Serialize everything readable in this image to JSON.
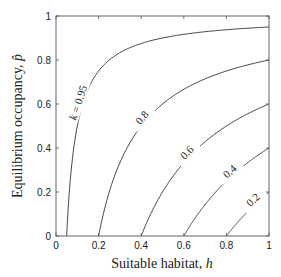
{
  "chart_data": {
    "type": "line",
    "title": "",
    "xlabel": "Suitable habitat, h",
    "ylabel": "Equilibrium occupancy, p̂",
    "xlim": [
      0,
      1
    ],
    "ylim": [
      0,
      1
    ],
    "grid": false,
    "legend": "none (curves labelled inline)",
    "x_ticks": [
      "0",
      "0.2",
      "0.4",
      "0.6",
      "0.8",
      "1"
    ],
    "y_ticks": [
      "0",
      "0.2",
      "0.4",
      "0.6",
      "0.8",
      "1"
    ],
    "formula": "p̂ = 1 − (1 − k)/h",
    "series": [
      {
        "name": "k = 0.95",
        "k": 0.95,
        "label": "k = 0.95",
        "x_intercept": 0.05,
        "value_at_h1": 0.95,
        "points": [
          [
            0.05,
            0
          ],
          [
            0.06,
            0.167
          ],
          [
            0.08,
            0.375
          ],
          [
            0.1,
            0.5
          ],
          [
            0.15,
            0.667
          ],
          [
            0.2,
            0.75
          ],
          [
            0.3,
            0.833
          ],
          [
            0.4,
            0.875
          ],
          [
            0.6,
            0.917
          ],
          [
            0.8,
            0.9375
          ],
          [
            1.0,
            0.95
          ]
        ]
      },
      {
        "name": "k = 0.8",
        "k": 0.8,
        "label": "0.8",
        "x_intercept": 0.2,
        "value_at_h1": 0.8,
        "points": [
          [
            0.2,
            0
          ],
          [
            0.25,
            0.2
          ],
          [
            0.3,
            0.333
          ],
          [
            0.4,
            0.5
          ],
          [
            0.5,
            0.6
          ],
          [
            0.6,
            0.667
          ],
          [
            0.7,
            0.714
          ],
          [
            0.8,
            0.75
          ],
          [
            0.9,
            0.778
          ],
          [
            1.0,
            0.8
          ]
        ]
      },
      {
        "name": "k = 0.6",
        "k": 0.6,
        "label": "0.6",
        "x_intercept": 0.4,
        "value_at_h1": 0.6,
        "points": [
          [
            0.4,
            0
          ],
          [
            0.5,
            0.2
          ],
          [
            0.6,
            0.333
          ],
          [
            0.7,
            0.429
          ],
          [
            0.8,
            0.5
          ],
          [
            0.9,
            0.556
          ],
          [
            1.0,
            0.6
          ]
        ]
      },
      {
        "name": "k = 0.4",
        "k": 0.4,
        "label": "0.4",
        "x_intercept": 0.6,
        "value_at_h1": 0.4,
        "points": [
          [
            0.6,
            0
          ],
          [
            0.7,
            0.143
          ],
          [
            0.8,
            0.25
          ],
          [
            0.9,
            0.333
          ],
          [
            1.0,
            0.4
          ]
        ]
      },
      {
        "name": "k = 0.2",
        "k": 0.2,
        "label": "0.2",
        "x_intercept": 0.8,
        "value_at_h1": 0.2,
        "points": [
          [
            0.8,
            0
          ],
          [
            0.85,
            0.059
          ],
          [
            0.9,
            0.111
          ],
          [
            0.95,
            0.158
          ],
          [
            1.0,
            0.2
          ]
        ]
      }
    ]
  },
  "plot": {
    "left": 56,
    "right": 269,
    "top": 16,
    "bottom": 236
  },
  "labels": {
    "x_axis": "Suitable habitat, ",
    "x_axis_var": "h",
    "y_axis": "Equilibrium occupancy, ",
    "y_axis_var": "p̂",
    "k_prefix": "k",
    "k_first": " = 0.95"
  }
}
